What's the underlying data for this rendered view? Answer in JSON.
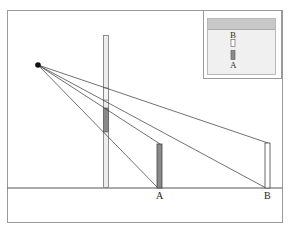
{
  "diagram": {
    "labels": {
      "post_a": "A",
      "post_b": "B"
    },
    "inset": {
      "label_top": "B",
      "label_bottom": "A"
    },
    "colors": {
      "frame": "#9a9a9a",
      "line": "#333333",
      "post_dark": "#8a8a8a",
      "pole_fill": "#e4e4e4",
      "inset_bg": "#f0f0f0",
      "inset_band": "#c8c8c8"
    }
  }
}
